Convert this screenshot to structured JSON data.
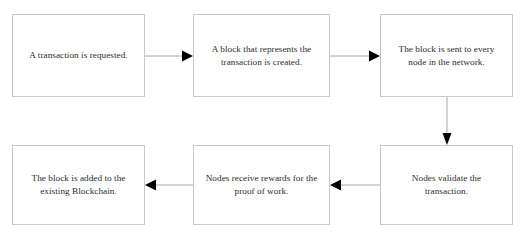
{
  "diagram": {
    "type": "flowchart",
    "background_color": "#ffffff",
    "node_border_color": "#c9c9cc",
    "node_fill_color": "#ffffff",
    "connector_line_color": "#a8a8ac",
    "arrowhead_color": "#000000",
    "text_color": "#2b2b2f",
    "nodes": [
      {
        "id": "step-1",
        "label": "A transaction is requested.",
        "x": 12,
        "y": 14,
        "w": 133,
        "h": 83
      },
      {
        "id": "step-2",
        "label": "A block that represents the transaction is created.",
        "x": 193,
        "y": 14,
        "w": 137,
        "h": 83
      },
      {
        "id": "step-3",
        "label": "The block is sent to every node in the network.",
        "x": 380,
        "y": 14,
        "w": 133,
        "h": 83
      },
      {
        "id": "step-4",
        "label": "Nodes validate the transaction.",
        "x": 380,
        "y": 145,
        "w": 133,
        "h": 80
      },
      {
        "id": "step-5",
        "label": "Nodes receive rewards for the proof of work.",
        "x": 193,
        "y": 145,
        "w": 137,
        "h": 80
      },
      {
        "id": "step-6",
        "label": "The block is added to the existing Blockchain.",
        "x": 12,
        "y": 145,
        "w": 133,
        "h": 80
      }
    ],
    "connectors": [
      {
        "id": "arrow-1-to-2",
        "from": "step-1",
        "to": "step-2",
        "direction": "right"
      },
      {
        "id": "arrow-2-to-3",
        "from": "step-2",
        "to": "step-3",
        "direction": "right"
      },
      {
        "id": "arrow-3-to-4",
        "from": "step-3",
        "to": "step-4",
        "direction": "down"
      },
      {
        "id": "arrow-4-to-5",
        "from": "step-4",
        "to": "step-5",
        "direction": "left"
      },
      {
        "id": "arrow-5-to-6",
        "from": "step-5",
        "to": "step-6",
        "direction": "left"
      }
    ]
  }
}
